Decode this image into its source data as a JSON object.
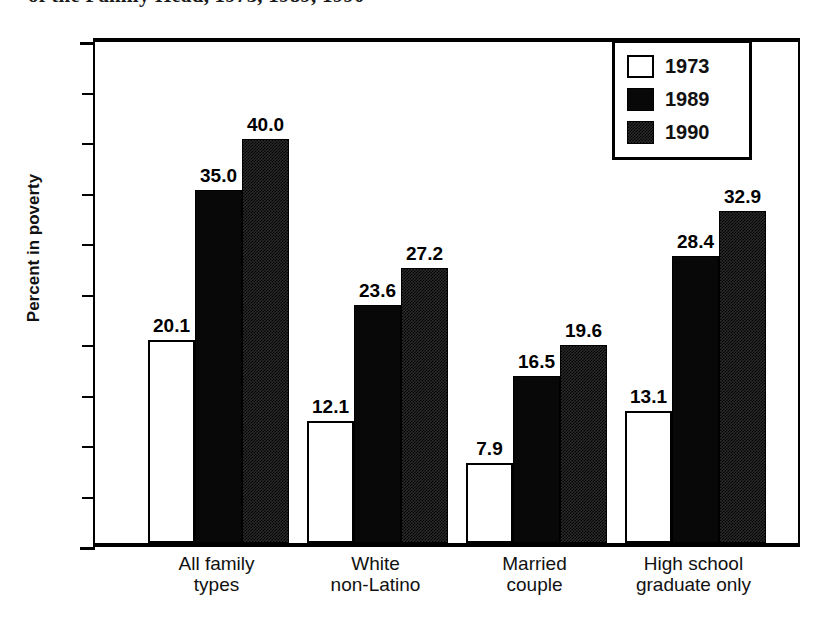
{
  "title": "of the Family Head, 1973, 1989, 1990",
  "chart_data": {
    "type": "bar",
    "title": "of the Family Head, 1973, 1989, 1990",
    "xlabel": "",
    "ylabel": "Percent in poverty",
    "ylim": [
      0,
      50
    ],
    "ytick_step": 5,
    "yticks": [
      "0",
      "5",
      "10",
      "15",
      "20",
      "25",
      "30",
      "35",
      "40",
      "45",
      "50"
    ],
    "grid": false,
    "legend_position": "top-right",
    "categories": [
      "All family\ntypes",
      "White\nnon-Latino",
      "Married\ncouple",
      "High school\ngraduate only"
    ],
    "category_lines": [
      [
        "All family",
        "types"
      ],
      [
        "White",
        "non-Latino"
      ],
      [
        "Married",
        "couple"
      ],
      [
        "High school",
        "graduate only"
      ]
    ],
    "series": [
      {
        "name": "1973",
        "fill": "white",
        "values": [
          20.1,
          12.1,
          7.9,
          13.1
        ],
        "labels": [
          "20.1",
          "12.1",
          "7.9",
          "13.1"
        ]
      },
      {
        "name": "1989",
        "fill": "solid-black",
        "values": [
          35.0,
          23.6,
          16.5,
          28.4
        ],
        "labels": [
          "35.0",
          "23.6",
          "16.5",
          "28.4"
        ]
      },
      {
        "name": "1990",
        "fill": "stippled-dark",
        "values": [
          40.0,
          27.2,
          19.6,
          32.9
        ],
        "labels": [
          "40.0",
          "27.2",
          "19.6",
          "32.9"
        ]
      }
    ]
  },
  "legend": {
    "items": [
      {
        "label": "1973",
        "swatch": "white-square-icon"
      },
      {
        "label": "1989",
        "swatch": "black-square-icon"
      },
      {
        "label": "1990",
        "swatch": "stippled-square-icon"
      }
    ]
  }
}
